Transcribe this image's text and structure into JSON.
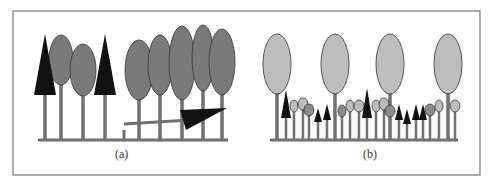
{
  "frame": {
    "x": 13,
    "y": 11,
    "w": 467,
    "h": 164,
    "stroke": "#777777"
  },
  "colors": {
    "trunk": "#707070",
    "ground": "#707070",
    "dark_crown": "#7a7a7a",
    "light_crown": "#bdbdbd",
    "mid_crown": "#8c8c8c",
    "conifer": "#111111",
    "outline": "#333333"
  },
  "panels": [
    {
      "id": "a",
      "caption": "(a)",
      "description": "Even-aged stand with a fallen tree creating a gap",
      "ground": {
        "x1": 38,
        "x2": 228,
        "y": 140
      },
      "conifers": [
        {
          "x": 45,
          "top": 34,
          "base": 95,
          "half": 11,
          "trunk_bottom": 140
        },
        {
          "x": 105,
          "top": 34,
          "base": 95,
          "half": 11,
          "trunk_bottom": 140
        }
      ],
      "broadleaves": [
        {
          "cx": 61,
          "cy": 60,
          "rx": 12,
          "ry": 25,
          "trunk_bottom": 140
        },
        {
          "cx": 83,
          "cy": 70,
          "rx": 13,
          "ry": 26,
          "trunk_bottom": 140
        },
        {
          "cx": 139,
          "cy": 70,
          "rx": 14,
          "ry": 30,
          "trunk_bottom": 140
        },
        {
          "cx": 160,
          "cy": 65,
          "rx": 12,
          "ry": 30,
          "trunk_bottom": 140
        },
        {
          "cx": 182,
          "cy": 63,
          "rx": 13,
          "ry": 37,
          "trunk_bottom": 140
        },
        {
          "cx": 203,
          "cy": 58,
          "rx": 11,
          "ry": 33,
          "trunk_bottom": 140
        },
        {
          "cx": 222,
          "cy": 62,
          "rx": 13,
          "ry": 33,
          "trunk_bottom": 140
        }
      ],
      "stump": {
        "x": 124,
        "y1": 130,
        "y2": 140
      },
      "fallen_tree": {
        "x1": 124,
        "y1": 124,
        "x2": 190,
        "y2": 120,
        "crown": [
          [
            180,
            110
          ],
          [
            227,
            108
          ],
          [
            186,
            130
          ]
        ]
      }
    },
    {
      "id": "b",
      "caption": "(b)",
      "description": "Uneven-aged stand with tall trees above a regenerating understory",
      "ground": {
        "x1": 270,
        "x2": 458,
        "y": 140
      },
      "tall_trees": [
        {
          "cx": 277,
          "cy": 64,
          "rx": 14,
          "ry": 30,
          "trunk_bottom": 140
        },
        {
          "cx": 335,
          "cy": 64,
          "rx": 14,
          "ry": 30,
          "trunk_bottom": 140
        },
        {
          "cx": 390,
          "cy": 64,
          "rx": 14,
          "ry": 30,
          "trunk_bottom": 140
        },
        {
          "cx": 448,
          "cy": 64,
          "rx": 14,
          "ry": 30,
          "trunk_bottom": 140
        }
      ],
      "small_broadleaves": [
        {
          "cx": 294,
          "cy": 106,
          "rx": 4,
          "ry": 6,
          "fill": "light"
        },
        {
          "cx": 303,
          "cy": 104,
          "rx": 5,
          "ry": 6,
          "fill": "light"
        },
        {
          "cx": 309,
          "cy": 110,
          "rx": 5,
          "ry": 6,
          "fill": "mid"
        },
        {
          "cx": 342,
          "cy": 111,
          "rx": 4,
          "ry": 6,
          "fill": "mid"
        },
        {
          "cx": 350,
          "cy": 106,
          "rx": 4,
          "ry": 6,
          "fill": "light"
        },
        {
          "cx": 359,
          "cy": 106,
          "rx": 5,
          "ry": 6,
          "fill": "light"
        },
        {
          "cx": 376,
          "cy": 106,
          "rx": 4,
          "ry": 6,
          "fill": "light"
        },
        {
          "cx": 384,
          "cy": 104,
          "rx": 5,
          "ry": 6,
          "fill": "light"
        },
        {
          "cx": 390,
          "cy": 111,
          "rx": 5,
          "ry": 6,
          "fill": "mid"
        },
        {
          "cx": 430,
          "cy": 110,
          "rx": 5,
          "ry": 6,
          "fill": "mid"
        },
        {
          "cx": 439,
          "cy": 106,
          "rx": 4,
          "ry": 6,
          "fill": "light"
        },
        {
          "cx": 455,
          "cy": 106,
          "rx": 5,
          "ry": 6,
          "fill": "light"
        }
      ],
      "small_conifers": [
        {
          "x": 286,
          "top": 90,
          "base": 118,
          "half": 5
        },
        {
          "x": 318,
          "top": 108,
          "base": 122,
          "half": 4
        },
        {
          "x": 327,
          "top": 104,
          "base": 120,
          "half": 4
        },
        {
          "x": 367,
          "top": 88,
          "base": 118,
          "half": 5
        },
        {
          "x": 399,
          "top": 104,
          "base": 120,
          "half": 4
        },
        {
          "x": 407,
          "top": 109,
          "base": 124,
          "half": 4
        },
        {
          "x": 416,
          "top": 104,
          "base": 120,
          "half": 4
        },
        {
          "x": 423,
          "top": 104,
          "base": 120,
          "half": 4
        }
      ]
    }
  ]
}
